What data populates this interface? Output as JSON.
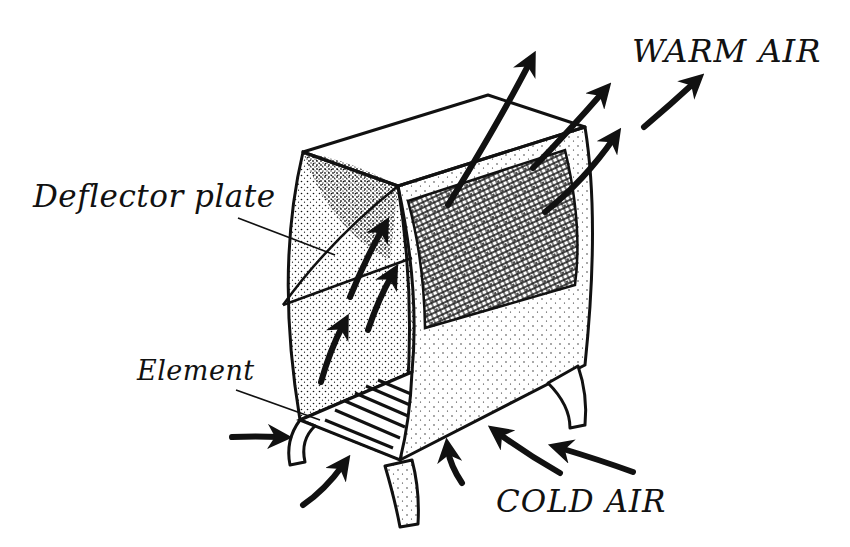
{
  "diagram": {
    "labels": {
      "warm_air": "WARM AIR",
      "cold_air": "COLD AIR",
      "deflector_plate": "Deflector plate",
      "element": "Element"
    },
    "colors": {
      "ink": "#111111",
      "background": "#ffffff"
    },
    "arrows": {
      "warm_out_count": 4,
      "internal_rising_count": 4,
      "cold_in_count": 5
    }
  }
}
